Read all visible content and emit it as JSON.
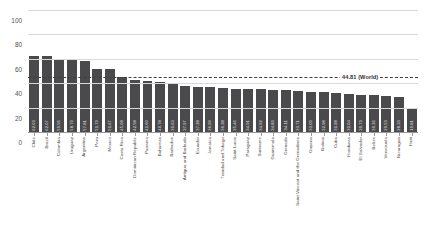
{
  "chart_data": {
    "type": "bar",
    "title": "",
    "xlabel": "",
    "ylabel": "",
    "ylim": [
      0,
      100
    ],
    "yticks": [
      "0",
      "20",
      "40",
      "60",
      "80",
      "100"
    ],
    "grid": true,
    "legend": "none",
    "bar_color": "#4a4a4c",
    "categories": [
      "Chile",
      "Brazil",
      "Colombia",
      "Uruguay",
      "Argentina",
      "Peru",
      "Mexico",
      "Costa Rica",
      "Dominican Republic",
      "Panama",
      "Bahamas",
      "Barbados",
      "Antigua and Barbuda",
      "Ecuador",
      "Jamaica",
      "Trinidad and Tobago",
      "Saint Lucia",
      "Paraguay",
      "Suriname",
      "Guatemala",
      "Grenada",
      "Saint Vincent and the Grenadines",
      "Guyana",
      "Bolivia",
      "Cuba",
      "Honduras",
      "El Salvador",
      "Belize",
      "Venezuela",
      "Nicaragua",
      "Haiti"
    ],
    "values": [
      62.03,
      62.07,
      59.56,
      58.79,
      57.81,
      51.79,
      51.67,
      45.08,
      42.58,
      41.6,
      40.78,
      39.63,
      37.97,
      37.28,
      36.99,
      36.38,
      35.46,
      34.91,
      34.92,
      34.83,
      34.11,
      33.71,
      33.09,
      32.98,
      31.98,
      31.04,
      30.73,
      30.36,
      29.53,
      28.33,
      19.81
    ],
    "value_labels": [
      "62.03",
      "62.07",
      "59.56",
      "58.79",
      "57.81",
      "51.79",
      "51.67",
      "45.08",
      "42.58",
      "41.60",
      "40.78",
      "39.63",
      "37.97",
      "37.28",
      "36.99",
      "36.38",
      "35.46",
      "34.91",
      "34.92",
      "34.83",
      "34.11",
      "33.71",
      "33.09",
      "32.98",
      "31.98",
      "31.04",
      "30.73",
      "30.36",
      "29.53",
      "28.33",
      "19.81"
    ],
    "annotations": [
      {
        "name": "world-average-line",
        "value": 44.81,
        "label": "44.81 (World)",
        "style": "dashed"
      }
    ]
  },
  "footnote": {
    "text": ""
  }
}
